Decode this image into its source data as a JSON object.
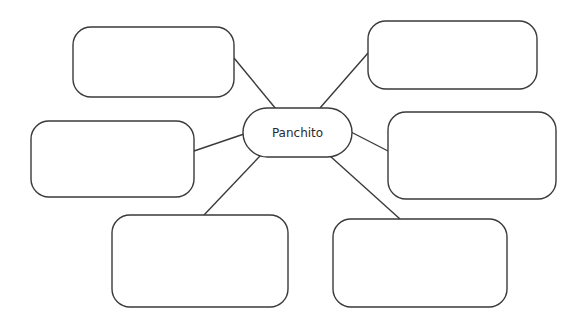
{
  "diagram": {
    "type": "concept-map",
    "center": {
      "label": "Panchito"
    },
    "stroke_color": "#3a3a3a",
    "background": "#ffffff",
    "boxes": [
      {
        "id": "top-left",
        "text": ""
      },
      {
        "id": "top-right",
        "text": ""
      },
      {
        "id": "middle-left",
        "text": ""
      },
      {
        "id": "middle-right",
        "text": ""
      },
      {
        "id": "bottom-left",
        "text": ""
      },
      {
        "id": "bottom-right",
        "text": ""
      }
    ]
  }
}
